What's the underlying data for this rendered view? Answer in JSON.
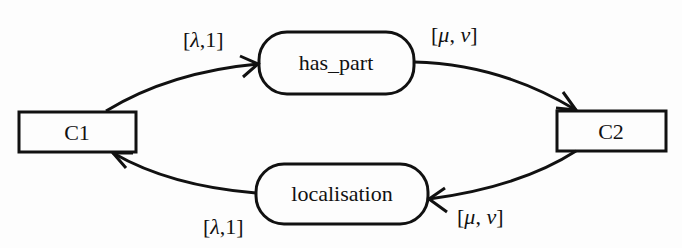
{
  "diagram": {
    "nodes": {
      "c1": {
        "label": "C1",
        "shape": "rectangle"
      },
      "c2": {
        "label": "C2",
        "shape": "rectangle"
      },
      "has_part": {
        "label": "has_part",
        "shape": "rounded-rectangle"
      },
      "localisation": {
        "label": "localisation",
        "shape": "rounded-rectangle"
      }
    },
    "edges": [
      {
        "from": "C1",
        "to": "has_part",
        "label_open": "[",
        "label_a": "λ",
        "label_sep": ",",
        "label_b": "1",
        "label_close": "]"
      },
      {
        "from": "has_part",
        "to": "C2",
        "label_open": "[",
        "label_a": "μ",
        "label_sep": ",",
        "label_b": "ν",
        "label_close": "]"
      },
      {
        "from": "C2",
        "to": "localisation",
        "label_open": "[",
        "label_a": "μ",
        "label_sep": ",",
        "label_b": "ν",
        "label_close": "]"
      },
      {
        "from": "localisation",
        "to": "C1",
        "label_open": "[",
        "label_a": "λ",
        "label_sep": ",",
        "label_b": "1",
        "label_close": "]"
      }
    ],
    "colors": {
      "stroke": "#111111",
      "background": "#fdfdfd"
    }
  }
}
